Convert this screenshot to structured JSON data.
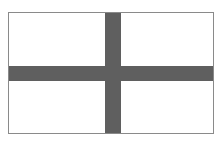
{
  "figure": {
    "field_color": "#ffffff",
    "cross_color": "#5f5f5f",
    "border_color": "#8a8a8a"
  }
}
